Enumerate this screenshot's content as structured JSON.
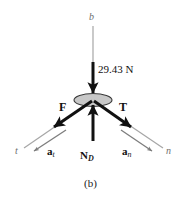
{
  "figure": {
    "caption": "(b)",
    "type": "free-body-diagram",
    "background_color": "#ffffff"
  },
  "body_marker": {
    "name": "drum-ellipse",
    "fill_color": "#c8c8c8",
    "stroke_color": "#3a3a3a"
  },
  "axes": [
    {
      "id": "b",
      "label": "b",
      "color": "#9a9a9a",
      "orientation": "vertical-up"
    },
    {
      "id": "t",
      "label": "t",
      "color": "#9a9a9a",
      "orientation": "down-left"
    },
    {
      "id": "n",
      "label": "n",
      "color": "#9a9a9a",
      "orientation": "down-right"
    }
  ],
  "vectors": [
    {
      "id": "weight",
      "label": "",
      "magnitude_label": "29.43 N",
      "direction": "down",
      "color": "#111111",
      "style": "thick"
    },
    {
      "id": "F",
      "label": "F",
      "subscript": "",
      "direction": "down-left",
      "color": "#111111",
      "style": "thick"
    },
    {
      "id": "T",
      "label": "T",
      "subscript": "",
      "direction": "down-right",
      "color": "#111111",
      "style": "thick"
    },
    {
      "id": "ND",
      "label": "N",
      "subscript": "D",
      "direction": "up",
      "color": "#111111",
      "style": "thick"
    },
    {
      "id": "at",
      "label": "a",
      "subscript": "t",
      "direction": "down-left",
      "color": "#6e6e6e",
      "style": "thin"
    },
    {
      "id": "an",
      "label": "a",
      "subscript": "n",
      "direction": "down-right",
      "color": "#6e6e6e",
      "style": "thin"
    }
  ],
  "labels": {
    "axis_b": "b",
    "axis_t": "t",
    "axis_n": "n",
    "force_F": "F",
    "force_T": "T",
    "force_N": "N",
    "force_N_sub": "D",
    "accel_a_t": "a",
    "accel_a_t_sub": "t",
    "accel_a_n": "a",
    "accel_a_n_sub": "n",
    "weight_magnitude": "29.43 N",
    "caption": "(b)"
  }
}
